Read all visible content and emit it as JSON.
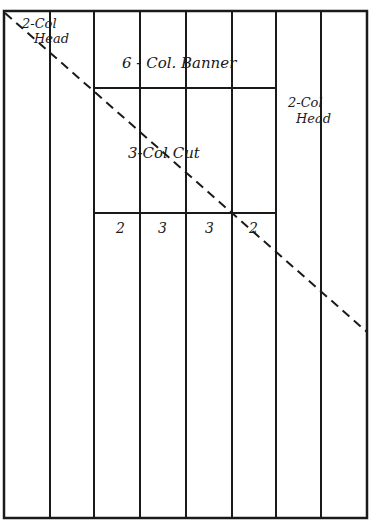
{
  "diagram": {
    "colors": {
      "line": "#1a1a1a",
      "background": "#ffffff"
    },
    "page": {
      "columns": 8
    },
    "labels": {
      "top_left_head": [
        "2-Col",
        "Head"
      ],
      "banner": "6 - Col. Banner",
      "right_head": [
        "2-Col",
        "Head"
      ],
      "cut": "3-Col Cut",
      "bottom_numbers": [
        "2",
        "3",
        "3",
        "2"
      ]
    },
    "annotations": {
      "diagonal": "dashed diagonal line from top-left corner to right edge"
    }
  }
}
